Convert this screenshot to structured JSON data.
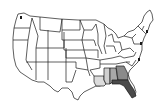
{
  "map": {
    "title": "United States map",
    "type": "choropleth",
    "colors": {
      "background": "#ffffff",
      "state_fill": "#ffffff",
      "border": "#1a1a1a",
      "highlight_light": "#d8d8d8",
      "highlight_mid": "#8a8a8a",
      "highlight_dark": "#4a4a4a"
    },
    "highlighted_states": [
      {
        "name": "Louisiana",
        "shade": "light"
      },
      {
        "name": "Mississippi",
        "shade": "light"
      },
      {
        "name": "Alabama",
        "shade": "mid"
      },
      {
        "name": "Georgia",
        "shade": "mid"
      },
      {
        "name": "Florida",
        "shade": "dark"
      }
    ]
  }
}
